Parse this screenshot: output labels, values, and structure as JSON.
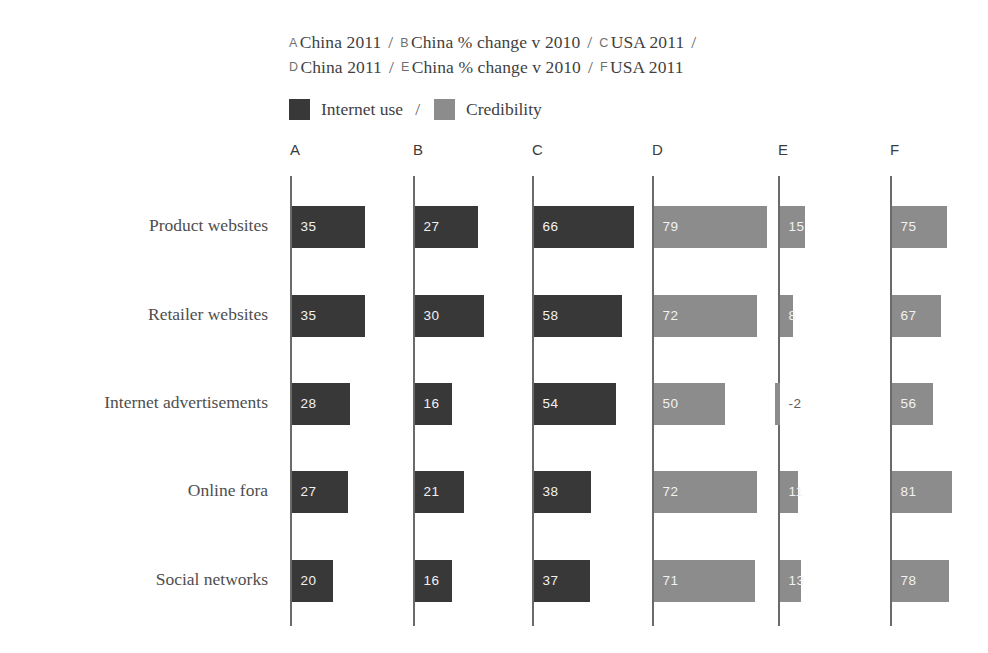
{
  "key": {
    "lines": [
      [
        {
          "letter": "A",
          "text": "China 2011"
        },
        {
          "letter": "B",
          "text": "China % change v 2010"
        },
        {
          "letter": "C",
          "text": "USA 2011"
        }
      ],
      [
        {
          "letter": "D",
          "text": "China 2011"
        },
        {
          "letter": "E",
          "text": "China % change v 2010"
        },
        {
          "letter": "F",
          "text": "USA 2011"
        }
      ]
    ],
    "separator": "/",
    "trailing_separator": "/"
  },
  "legend": {
    "separator": "/",
    "items": [
      {
        "label": "Internet use",
        "color": "#383838"
      },
      {
        "label": "Credibility",
        "color": "#8c8c8c"
      }
    ]
  },
  "colors": {
    "internet_use": "#383838",
    "credibility": "#8c8c8c",
    "axis": "#6a6a6a",
    "text": "#4e4e4e",
    "negative_label": "#5d5d5d",
    "background": "#ffffff"
  },
  "chart_data": {
    "type": "bar",
    "title": "",
    "subtitle": "",
    "xlabel": "",
    "ylabel": "",
    "grid": false,
    "orientation": "horizontal",
    "legend_position": "top",
    "panel_note": "Six independent small-multiple panels (A-F); each panel has its own baseline at zero; A-C use the 'Internet use' dark series, D-F use the 'Credibility' grey series.",
    "categories": [
      "Product websites",
      "Retailer websites",
      "Internet advertisements",
      "Online fora",
      "Social networks"
    ],
    "panels": [
      {
        "letter": "A",
        "caption": "China 2011",
        "series": "Internet use",
        "color": "#383838",
        "values": [
          35,
          35,
          28,
          27,
          20
        ],
        "labels": [
          "35",
          "35",
          "28",
          "27",
          "20"
        ]
      },
      {
        "letter": "B",
        "caption": "China % change v 2010",
        "series": "Internet use",
        "color": "#383838",
        "values": [
          27,
          30,
          16,
          21,
          16
        ],
        "labels": [
          "27",
          "30",
          "16",
          "21",
          "16"
        ]
      },
      {
        "letter": "C",
        "caption": "USA 2011",
        "series": "Internet use",
        "color": "#383838",
        "values": [
          66,
          58,
          54,
          38,
          37
        ],
        "labels": [
          "66",
          "58",
          "54",
          "38",
          "37"
        ]
      },
      {
        "letter": "D",
        "caption": "China 2011",
        "series": "Credibility",
        "color": "#8c8c8c",
        "values": [
          79,
          72,
          50,
          72,
          71
        ],
        "labels": [
          "79",
          "72",
          "50",
          "72",
          "71"
        ]
      },
      {
        "letter": "E",
        "caption": "China % change v 2010",
        "series": "Credibility",
        "color": "#8c8c8c",
        "values": [
          15,
          8,
          -2,
          11,
          13
        ],
        "labels": [
          "15",
          "8",
          "-2",
          "11",
          "13"
        ]
      },
      {
        "letter": "F",
        "caption": "USA 2011",
        "series": "Credibility",
        "color": "#8c8c8c",
        "values": [
          75,
          67,
          56,
          81,
          78
        ],
        "labels": [
          "75",
          "67",
          "56",
          "81",
          "78"
        ]
      }
    ]
  },
  "layout": {
    "axis_x": [
      290,
      413,
      532,
      652,
      778,
      890
    ],
    "header_y": 152,
    "axis_top": 176,
    "axis_bottom": 626,
    "row_centers": [
      227,
      316,
      404,
      492,
      581
    ],
    "bar_height": 42,
    "label_right_edge": 268,
    "px_per_unit": [
      2.09,
      2.33,
      1.52,
      1.43,
      1.67,
      0.74
    ]
  }
}
